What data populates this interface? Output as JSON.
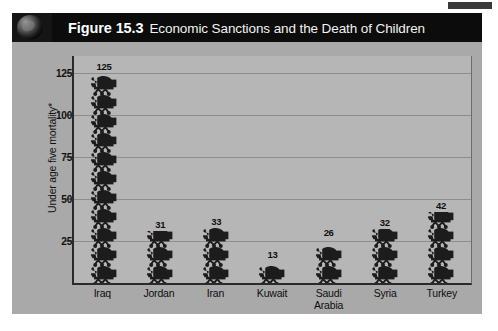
{
  "figure": {
    "number": "Figure 15.3",
    "caption": "Economic Sanctions and the Death of Children",
    "badge_icon": "globe-icon"
  },
  "chart_data": {
    "type": "bar",
    "title": "Economic Sanctions and the Death of Children",
    "categories": [
      "Iraq",
      "Jordan",
      "Iran",
      "Kuwait",
      "Saudi Arabia",
      "Syria",
      "Turkey"
    ],
    "category_lines": [
      [
        "Iraq"
      ],
      [
        "Jordan"
      ],
      [
        "Iran"
      ],
      [
        "Kuwait"
      ],
      [
        "Saudi",
        "Arabia"
      ],
      [
        "Syria"
      ],
      [
        "Turkey"
      ]
    ],
    "values": [
      125,
      31,
      33,
      13,
      26,
      32,
      42
    ],
    "xlabel": "",
    "ylabel": "Under age five mortality*",
    "ylim": [
      0,
      135
    ],
    "yticks": [
      25,
      50,
      75,
      100,
      125
    ],
    "grid": true,
    "legend": "none",
    "marker_icon": "baby-stroller-icon",
    "colors": {
      "panel": "#a9a9a9",
      "plot": "#b6b6b6",
      "grid": "#8d8d8d",
      "axis": "#2a2a2a",
      "marker": "#1c1c1c",
      "header_bg": "#0c0c0c",
      "header_text": "#ffffff"
    }
  }
}
